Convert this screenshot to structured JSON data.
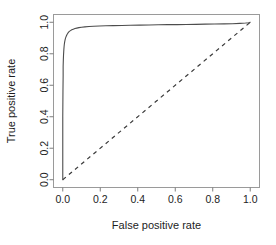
{
  "figure": {
    "kind": "roc-plot",
    "background_color": "#ffffff",
    "box_border_color": "#9a9a9a",
    "axis_color": "#7d7d7d",
    "text_color": "#1d1d1d"
  },
  "chart_data": {
    "type": "line",
    "title": "",
    "subtitle": "",
    "xlabel": "False positive rate",
    "ylabel": "True positive rate",
    "xlim": [
      0.0,
      1.0
    ],
    "ylim": [
      0.0,
      1.0
    ],
    "grid": false,
    "legend": null,
    "legend_position": "none",
    "xticks": [
      0.0,
      0.2,
      0.4,
      0.6,
      0.8,
      1.0
    ],
    "xticklabels": [
      "0.0",
      "0.2",
      "0.4",
      "0.6",
      "0.8",
      "1.0"
    ],
    "yticks": [
      0.0,
      0.2,
      0.4,
      0.6,
      0.8,
      1.0
    ],
    "yticklabels": [
      "0.0",
      "0.2",
      "0.4",
      "0.6",
      "0.8",
      "1.0"
    ],
    "series": [
      {
        "name": "ROC curve",
        "style": "solid",
        "color": "#4d4d4d",
        "width": 1.1,
        "x": [
          0.0,
          0.0,
          0.0,
          0.001,
          0.002,
          0.002,
          0.003,
          0.004,
          0.005,
          0.006,
          0.007,
          0.008,
          0.009,
          0.01,
          0.012,
          0.014,
          0.016,
          0.019,
          0.022,
          0.026,
          0.03,
          0.035,
          0.041,
          0.048,
          0.056,
          0.065,
          0.075,
          0.086,
          0.1,
          0.118,
          0.14,
          0.165,
          0.195,
          0.23,
          0.27,
          0.315,
          0.36,
          0.41,
          0.46,
          0.51,
          0.56,
          0.61,
          0.66,
          0.71,
          0.76,
          0.81,
          0.86,
          0.905,
          0.945,
          0.975,
          0.992,
          1.0
        ],
        "y": [
          0.0,
          0.18,
          0.4,
          0.56,
          0.66,
          0.72,
          0.76,
          0.79,
          0.812,
          0.83,
          0.845,
          0.857,
          0.866,
          0.874,
          0.886,
          0.896,
          0.904,
          0.913,
          0.921,
          0.929,
          0.936,
          0.942,
          0.947,
          0.952,
          0.956,
          0.96,
          0.963,
          0.966,
          0.968,
          0.971,
          0.973,
          0.975,
          0.976,
          0.978,
          0.979,
          0.98,
          0.981,
          0.982,
          0.983,
          0.984,
          0.985,
          0.985,
          0.986,
          0.987,
          0.988,
          0.989,
          0.99,
          0.991,
          0.993,
          0.995,
          0.997,
          1.0
        ]
      },
      {
        "name": "Chance diagonal",
        "style": "dashed",
        "color": "#3a3a3a",
        "width": 1.2,
        "x": [
          0.0,
          1.0
        ],
        "y": [
          0.0,
          1.0
        ]
      }
    ]
  },
  "axes": {
    "x_title": "False positive rate",
    "y_title": "True positive rate",
    "x_tick_labels": [
      "0.0",
      "0.2",
      "0.4",
      "0.6",
      "0.8",
      "1.0"
    ],
    "y_tick_labels": [
      "0.0",
      "0.2",
      "0.4",
      "0.6",
      "0.8",
      "1.0"
    ]
  }
}
